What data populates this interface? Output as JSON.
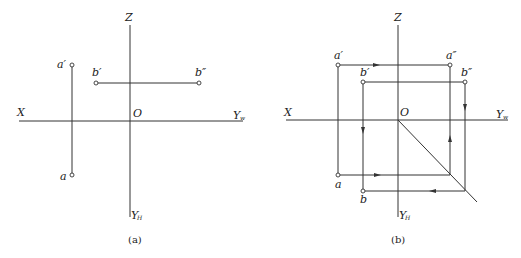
{
  "figures": [
    {
      "id": "a",
      "caption": "(a)",
      "axes": {
        "x_label": "X",
        "z_label": "Z",
        "origin_label": "O",
        "yw_label": "Y",
        "yw_sub": "w",
        "yh_label": "Y",
        "yh_sub": "H"
      },
      "points": {
        "a_prime": "a′",
        "a": "a",
        "b_prime": "b′",
        "b_double_prime": "b″"
      }
    },
    {
      "id": "b",
      "caption": "(b)",
      "axes": {
        "x_label": "X",
        "z_label": "Z",
        "origin_label": "O",
        "yw_label": "Y",
        "yw_sub": "w",
        "yh_label": "Y",
        "yh_sub": "H"
      },
      "points": {
        "a_prime": "a′",
        "a_double_prime": "a″",
        "a": "a",
        "b_prime": "b′",
        "b_double_prime": "b″",
        "b": "b"
      }
    }
  ]
}
